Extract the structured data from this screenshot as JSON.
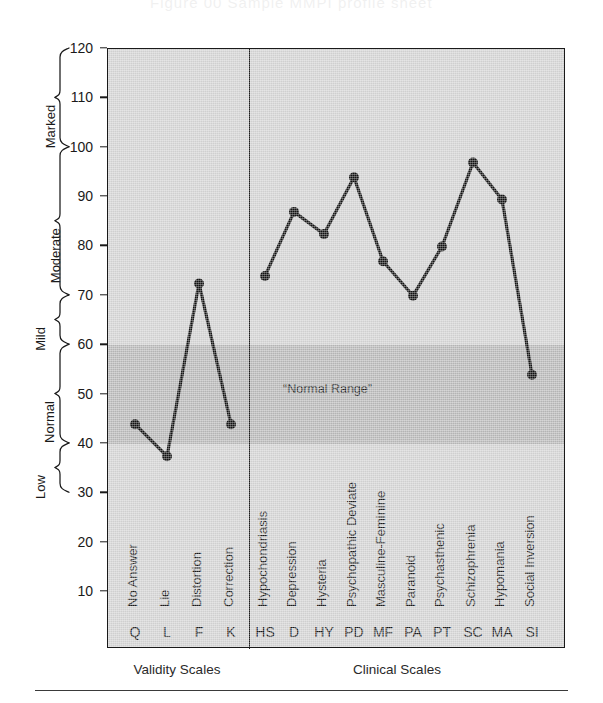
{
  "figure": {
    "ghost_running_head": "Figure 00  Sample MMPI profile sheet",
    "normal_range_label": "“Normal Range”",
    "group_captions": [
      {
        "label": "Validity Scales",
        "center_x": 177
      },
      {
        "label": "Clinical Scales",
        "center_x": 397
      }
    ],
    "severity_brackets": [
      {
        "label": "Marked",
        "from": 100,
        "to": 120
      },
      {
        "label": "Moderate",
        "from": 70,
        "to": 100
      },
      {
        "label": "Mild",
        "from": 60,
        "to": 70
      },
      {
        "label": "Normal",
        "from": 40,
        "to": 60
      },
      {
        "label": "Low",
        "from": 30,
        "to": 40
      }
    ]
  },
  "chart_data": {
    "type": "line",
    "title": "",
    "xlabel": "",
    "ylabel": "",
    "ylim": [
      5,
      120
    ],
    "ytick_values": [
      10,
      20,
      30,
      40,
      50,
      60,
      70,
      80,
      90,
      100,
      110,
      120
    ],
    "ytick_labels": [
      "10",
      "20",
      "30",
      "40",
      "50",
      "60",
      "70",
      "80",
      "90",
      "100",
      "110",
      "120"
    ],
    "grid": false,
    "legend": "none",
    "normal_range": [
      40,
      60
    ],
    "group_divider_after": "K",
    "categories": [
      "Q",
      "L",
      "F",
      "K",
      "HS",
      "D",
      "HY",
      "PD",
      "MF",
      "PA",
      "PT",
      "SC",
      "MA",
      "SI"
    ],
    "category_names": [
      "No Answer",
      "Lie",
      "Distortion",
      "Correction",
      "Hypochondriasis",
      "Depression",
      "Hysteria",
      "Psychopathic Deviate",
      "Masculine-Feminine",
      "Paranoid",
      "Psychasthenic",
      "Schizophrenia",
      "Hypomania",
      "Social Inversion"
    ],
    "category_groups": [
      "Validity Scales",
      "Validity Scales",
      "Validity Scales",
      "Validity Scales",
      "Clinical Scales",
      "Clinical Scales",
      "Clinical Scales",
      "Clinical Scales",
      "Clinical Scales",
      "Clinical Scales",
      "Clinical Scales",
      "Clinical Scales",
      "Clinical Scales",
      "Clinical Scales"
    ],
    "values": [
      44,
      37.5,
      72.5,
      44,
      74,
      87,
      82.5,
      94,
      77,
      70,
      80,
      97,
      89.5,
      54
    ],
    "series": [
      {
        "name": "T-score profile",
        "values": [
          44,
          37.5,
          72.5,
          44,
          74,
          87,
          82.5,
          94,
          77,
          70,
          80,
          97,
          89.5,
          54
        ]
      }
    ],
    "line_break_between": [
      "K",
      "HS"
    ],
    "marker": "filled-circle",
    "colors": {
      "line": "#111111",
      "marker": "#111111",
      "plot_background": "#cfcfcf",
      "normal_band": "#b4b4b4",
      "axis": "#1a1a1a"
    }
  }
}
